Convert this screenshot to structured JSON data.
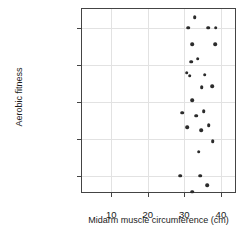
{
  "chart_data": {
    "type": "scatter",
    "title": "",
    "xlabel": "Midarm muscle circumference (cm)",
    "ylabel": "Aerobic fitness",
    "xlim": [
      2,
      44.4
    ],
    "xticks": [
      10,
      20,
      30,
      40
    ],
    "xtick_labels": [
      "10",
      "20",
      "30",
      "40"
    ],
    "categories": [
      "Very poor",
      "Fair",
      "Good",
      "Excellent",
      "Superior"
    ],
    "ytick_labels": [
      "Superior",
      "Excellent",
      "Good",
      "Fair",
      "Very poor"
    ],
    "grid": true,
    "legend": "none",
    "point_color": "#2b2b2b",
    "points": [
      {
        "x": 31.0,
        "y": "Superior",
        "cat_index": 4,
        "offset": 0.0
      },
      {
        "x": 36.5,
        "y": "Superior",
        "cat_index": 4,
        "offset": 0.0
      },
      {
        "x": 38.6,
        "y": "Superior",
        "cat_index": 4,
        "offset": 0.0
      },
      {
        "x": 32.8,
        "y": "Superior",
        "cat_index": 4,
        "offset": -0.28
      },
      {
        "x": 30.6,
        "y": "Excellent",
        "cat_index": 3,
        "offset": 0.22
      },
      {
        "x": 35.6,
        "y": "Excellent",
        "cat_index": 3,
        "offset": 0.28
      },
      {
        "x": 31.9,
        "y": "Excellent",
        "cat_index": 3,
        "offset": -0.08
      },
      {
        "x": 33.6,
        "y": "Excellent",
        "cat_index": 3,
        "offset": -0.16
      },
      {
        "x": 32.2,
        "y": "Excellent",
        "cat_index": 3,
        "offset": -0.55
      },
      {
        "x": 38.4,
        "y": "Excellent",
        "cat_index": 3,
        "offset": -0.55
      },
      {
        "x": 29.4,
        "y": "Good",
        "cat_index": 2,
        "offset": 0.3
      },
      {
        "x": 35.3,
        "y": "Good",
        "cat_index": 2,
        "offset": 0.26
      },
      {
        "x": 32.2,
        "y": "Good",
        "cat_index": 2,
        "offset": -0.04
      },
      {
        "x": 34.8,
        "y": "Good",
        "cat_index": 2,
        "offset": -0.38
      },
      {
        "x": 37.6,
        "y": "Good",
        "cat_index": 2,
        "offset": -0.42
      },
      {
        "x": 31.5,
        "y": "Good",
        "cat_index": 2,
        "offset": -0.7
      },
      {
        "x": 33.9,
        "y": "Fair",
        "cat_index": 1,
        "offset": 0.36
      },
      {
        "x": 37.8,
        "y": "Fair",
        "cat_index": 1,
        "offset": 0.08
      },
      {
        "x": 34.6,
        "y": "Fair",
        "cat_index": 1,
        "offset": -0.22
      },
      {
        "x": 30.8,
        "y": "Fair",
        "cat_index": 1,
        "offset": -0.3
      },
      {
        "x": 36.7,
        "y": "Fair",
        "cat_index": 1,
        "offset": -0.36
      },
      {
        "x": 33.3,
        "y": "Fair",
        "cat_index": 1,
        "offset": -0.62
      },
      {
        "x": 32.1,
        "y": "Very poor",
        "cat_index": 0,
        "offset": 0.44
      },
      {
        "x": 36.3,
        "y": "Very poor",
        "cat_index": 0,
        "offset": 0.26
      },
      {
        "x": 28.9,
        "y": "Very poor",
        "cat_index": 0,
        "offset": 0.0
      },
      {
        "x": 34.4,
        "y": "Very poor",
        "cat_index": 0,
        "offset": 0.0
      }
    ]
  }
}
